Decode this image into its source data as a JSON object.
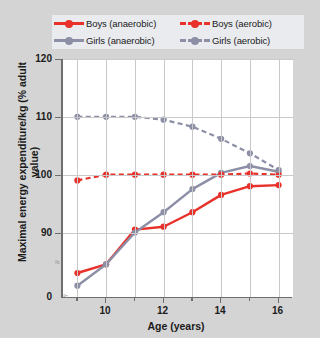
{
  "chart_data": {
    "type": "line",
    "title": "",
    "xlabel": "Age (years)",
    "ylabel": "Maximal energy expenditure/kg (% adult value)",
    "x": [
      9,
      10,
      11,
      12,
      13,
      14,
      15,
      16
    ],
    "xlim": [
      8.5,
      16.5
    ],
    "ylim": [
      85,
      120
    ],
    "yticks": [
      0,
      90,
      100,
      110,
      120
    ],
    "xticks": [
      10,
      12,
      14,
      16
    ],
    "grid": true,
    "axis_break": true,
    "legend_position": "top",
    "series": [
      {
        "name": "Boys (anaerobic)",
        "color": "#e8312a",
        "style": "solid",
        "values": [
          83.0,
          84.5,
          90.5,
          91.0,
          93.5,
          96.5,
          98.0,
          98.2
        ]
      },
      {
        "name": "Girls (anaerobic)",
        "color": "#8c8fa6",
        "style": "solid",
        "values": [
          80.8,
          84.5,
          90.0,
          93.5,
          97.5,
          100.3,
          101.5,
          100.5
        ]
      },
      {
        "name": "Boys (aerobic)",
        "color": "#e8312a",
        "style": "dashed",
        "values": [
          99.0,
          100.0,
          100.0,
          100.0,
          100.0,
          100.0,
          100.2,
          100.0
        ]
      },
      {
        "name": "Girls (aerobic)",
        "color": "#8c8fa6",
        "style": "dashed",
        "values": [
          110.0,
          110.0,
          110.0,
          109.5,
          108.3,
          106.2,
          103.7,
          100.8
        ]
      }
    ]
  },
  "legend": {
    "items": [
      {
        "label": "Boys (anaerobic)",
        "color": "#e8312a",
        "style": "solid"
      },
      {
        "label": "Boys (aerobic)",
        "color": "#e8312a",
        "style": "dashed"
      },
      {
        "label": "Girls (anaerobic)",
        "color": "#8c8fa6",
        "style": "solid"
      },
      {
        "label": "Girls (aerobic)",
        "color": "#8c8fa6",
        "style": "dashed"
      }
    ]
  },
  "axes": {
    "y_tick_labels": [
      "120",
      "110",
      "100",
      "90",
      "0"
    ],
    "x_tick_labels": [
      "10",
      "12",
      "14",
      "16"
    ],
    "y_title": "Maximal energy expenditure/kg (% adult value)",
    "x_title": "Age (years)",
    "break_marker": "≈"
  },
  "colors": {
    "red": "#e8312a",
    "gray_purple": "#8c8fa6",
    "figure_background": "#d4d4d4",
    "plot_background": "#ffffff",
    "gridline": "#c9c9c9",
    "axis": "#6e6e6e",
    "legend_background": "#e9ebee"
  }
}
